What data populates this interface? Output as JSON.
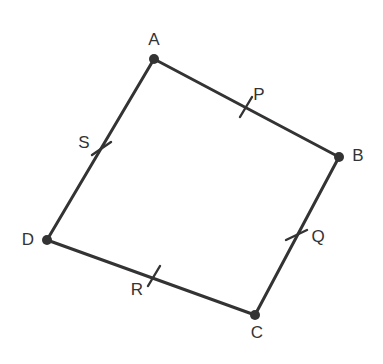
{
  "figure": {
    "type": "geometry-diagram",
    "background_color": "#ffffff",
    "stroke_color": "#333333",
    "stroke_width": 3,
    "dot_color": "#333333",
    "dot_radius": 5,
    "tick_stroke_width": 2.4,
    "label_font_size": 17,
    "canvas": {
      "width": 383,
      "height": 364
    }
  },
  "vertices": [
    {
      "id": "A",
      "label": "A",
      "x": 154,
      "y": 59,
      "label_x": 154,
      "label_y": 41
    },
    {
      "id": "B",
      "label": "B",
      "x": 339,
      "y": 157,
      "label_x": 358,
      "label_y": 157
    },
    {
      "id": "C",
      "label": "C",
      "x": 255,
      "y": 315,
      "label_x": 257,
      "label_y": 334
    },
    {
      "id": "D",
      "label": "D",
      "x": 47,
      "y": 240,
      "label_x": 28,
      "label_y": 241
    }
  ],
  "sides": [
    {
      "id": "AB",
      "from": "A",
      "to": "B",
      "x1": 154,
      "y1": 59,
      "x2": 339,
      "y2": 157
    },
    {
      "id": "BC",
      "from": "B",
      "to": "C",
      "x1": 339,
      "y1": 157,
      "x2": 255,
      "y2": 315
    },
    {
      "id": "CD",
      "from": "C",
      "to": "D",
      "x1": 255,
      "y1": 315,
      "x2": 47,
      "y2": 240
    },
    {
      "id": "DA",
      "from": "D",
      "to": "A",
      "x1": 47,
      "y1": 240,
      "x2": 154,
      "y2": 59
    }
  ],
  "midpoints": [
    {
      "id": "P",
      "label": "P",
      "on_side": "AB",
      "x": 246,
      "y": 107,
      "label_x": 259,
      "label_y": 96,
      "tick": {
        "x1": 240,
        "y1": 117,
        "x2": 252,
        "y2": 97
      }
    },
    {
      "id": "Q",
      "label": "Q",
      "on_side": "BC",
      "x": 297,
      "y": 235,
      "label_x": 318,
      "label_y": 238,
      "tick": {
        "x1": 286,
        "y1": 240,
        "x2": 307,
        "y2": 230
      }
    },
    {
      "id": "R",
      "label": "R",
      "on_side": "CD",
      "x": 154,
      "y": 276,
      "label_x": 137,
      "label_y": 291,
      "tick": {
        "x1": 148,
        "y1": 286,
        "x2": 160,
        "y2": 266
      }
    },
    {
      "id": "S",
      "label": "S",
      "on_side": "DA",
      "x": 101,
      "y": 148,
      "label_x": 84,
      "label_y": 144,
      "tick": {
        "x1": 92,
        "y1": 155,
        "x2": 111,
        "y2": 142
      }
    }
  ]
}
